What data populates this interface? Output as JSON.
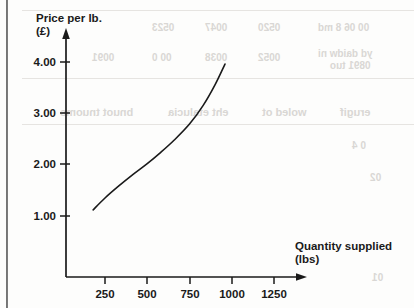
{
  "page": {
    "background_color": "#fdfdfc",
    "ink_color": "#1a1a1a",
    "ghost_color": "#d9d7d4",
    "binding_edge": "scan-binding-edge"
  },
  "chart_data": {
    "type": "line",
    "title": "",
    "subtitle": "",
    "xlabel": "Quantity supplied",
    "xlabel_unit": "(lbs)",
    "ylabel": "Price per lb.",
    "ylabel_unit": "(£)",
    "xlim": [
      0,
      1500
    ],
    "ylim": [
      0,
      4.4
    ],
    "xticks": [
      250,
      500,
      750,
      1000,
      1250
    ],
    "xtick_labels": [
      "250",
      "500",
      "750",
      "1000",
      "1250"
    ],
    "yticks": [
      1.0,
      2.0,
      3.0,
      4.0
    ],
    "ytick_labels": [
      "1.00",
      "2.00",
      "3.00",
      "4.00"
    ],
    "grid": false,
    "legend": false,
    "legend_position": "none",
    "annotations": [],
    "series": [
      {
        "name": "Supply curve",
        "color": "#1a1a1a",
        "line_width": 1.6,
        "x": [
          180,
          250,
          330,
          420,
          500,
          580,
          660,
          750,
          830,
          900,
          960
        ],
        "y": [
          1.12,
          1.35,
          1.58,
          1.82,
          2.02,
          2.24,
          2.48,
          2.79,
          3.15,
          3.55,
          3.96
        ]
      }
    ]
  },
  "ghost_text": {
    "rows": [
      {
        "text": "0523",
        "x": 152,
        "y": 22,
        "size": 10
      },
      {
        "text": "0047",
        "x": 205,
        "y": 22,
        "size": 10
      },
      {
        "text": "0520",
        "x": 258,
        "y": 22,
        "size": 10
      },
      {
        "text": "00 06 8 md",
        "x": 318,
        "y": 22,
        "size": 10
      },
      {
        "text": "0091",
        "x": 92,
        "y": 52,
        "size": 10
      },
      {
        "text": "00 0",
        "x": 152,
        "y": 52,
        "size": 10
      },
      {
        "text": "0038",
        "x": 205,
        "y": 52,
        "size": 10
      },
      {
        "text": "0052",
        "x": 258,
        "y": 52,
        "size": 10
      },
      {
        "text": "yd daidw ni",
        "x": 318,
        "y": 48,
        "size": 10
      },
      {
        "text": "0891 tuo",
        "x": 330,
        "y": 60,
        "size": 10
      },
      {
        "text": "bnuot tnuoms",
        "x": 60,
        "y": 106,
        "size": 11
      },
      {
        "text": "eht etalucia",
        "x": 168,
        "y": 106,
        "size": 11
      },
      {
        "text": "woled ot",
        "x": 262,
        "y": 106,
        "size": 11
      },
      {
        "text": "erugif",
        "x": 340,
        "y": 106,
        "size": 11
      },
      {
        "text": "0 4",
        "x": 352,
        "y": 140,
        "size": 10
      },
      {
        "text": "02",
        "x": 370,
        "y": 172,
        "size": 10
      },
      {
        "text": "01",
        "x": 372,
        "y": 272,
        "size": 10
      }
    ],
    "rules": [
      {
        "x": 22,
        "y": 10,
        "width": 392
      },
      {
        "x": 22,
        "y": 78,
        "width": 392
      },
      {
        "x": 22,
        "y": 124,
        "width": 392
      }
    ]
  }
}
